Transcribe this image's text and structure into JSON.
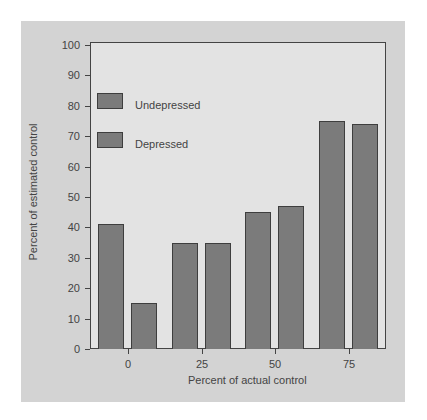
{
  "chart_data": {
    "type": "bar",
    "title": "",
    "xlabel": "Percent of actual control",
    "ylabel": "Percent of estimated control",
    "categories": [
      "0",
      "25",
      "50",
      "75"
    ],
    "series": [
      {
        "name": "Undepressed",
        "values": [
          41,
          35,
          45,
          75
        ]
      },
      {
        "name": "Depressed",
        "values": [
          15,
          35,
          47,
          74
        ]
      }
    ],
    "ylim": [
      0,
      100
    ],
    "yticks": [
      "0",
      "10",
      "20",
      "30",
      "40",
      "50",
      "60",
      "70",
      "80",
      "90",
      "100"
    ],
    "grid": false,
    "legend_position": "upper-left inside plot",
    "colors": {
      "bar": "#7b7b7b",
      "panel": "#d3d3d3",
      "plot_bg": "#e3e3e3"
    }
  }
}
